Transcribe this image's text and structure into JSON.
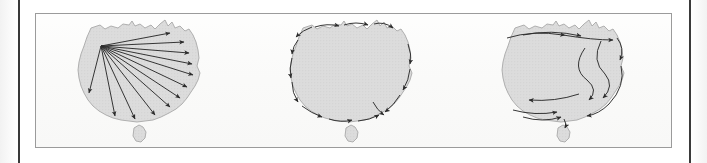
{
  "figure": {
    "type": "three-panel-map-diagram",
    "region": "Australia",
    "panel_count": 3,
    "frame": {
      "border_color": "#9b9b9b",
      "background": "#fbfbfa"
    },
    "page_rules": {
      "color": "#3a3a3a",
      "left_x": 18,
      "right_x": 689
    },
    "land": {
      "fill": "#dcdcdc",
      "stroke": "#a8a8a8",
      "texture": "stipple-dots",
      "texture_color": "#c6c6c6"
    },
    "arrows": {
      "color": "#2b2b2b",
      "stroke_width": 0.9
    }
  },
  "panels": [
    {
      "id": "panel-radial-dispersal",
      "name": "radial-arrows-map",
      "pattern": "radial",
      "origin_label": "north-west",
      "origin_point": [
        62,
        30
      ],
      "arrow_count": 12,
      "arrow_endpoints": [
        [
          133,
          18
        ],
        [
          147,
          27
        ],
        [
          152,
          38
        ],
        [
          155,
          49
        ],
        [
          156,
          60
        ],
        [
          150,
          72
        ],
        [
          143,
          83
        ],
        [
          133,
          92
        ],
        [
          118,
          100
        ],
        [
          98,
          104
        ],
        [
          78,
          101
        ],
        [
          52,
          78
        ]
      ]
    },
    {
      "id": "panel-coastal-circulation",
      "name": "coastal-arrows-map",
      "pattern": "perimeter",
      "arrow_count": 14,
      "description": "arrows following the coastline clockwise and anticlockwise"
    },
    {
      "id": "panel-interior-flow",
      "name": "interior-flow-arrows-map",
      "pattern": "curved-interior-flow",
      "arrow_count": 9,
      "description": "long curved flow lines crossing the interior"
    }
  ]
}
